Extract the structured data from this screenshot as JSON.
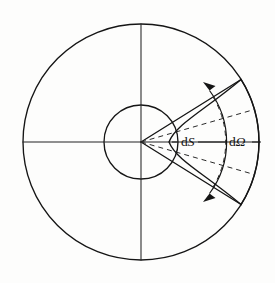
{
  "figure": {
    "background_color": "#fdfdfc",
    "line_color": "#151515",
    "labels": {
      "area_element": "dS",
      "solid_angle": "dΩ",
      "area_element_prefix": "d",
      "area_element_symbol": "S",
      "solid_angle_prefix": "d",
      "solid_angle_symbol": "Ω"
    },
    "geometry": {
      "center_x": 141,
      "center_y": 142,
      "outer_radius": 118,
      "inner_radius": 37,
      "sector_half_angle_deg": 32,
      "dashed_half_angle_deg": 16,
      "arrow_arc_radius": 86,
      "axis_lines": [
        "horizontal",
        "vertical"
      ]
    },
    "elements": [
      "outer-circle",
      "inner-circle",
      "horizontal-axis",
      "vertical-axis",
      "sector-upper-edge",
      "sector-lower-edge",
      "sector-outer-arc",
      "dashed-upper-ray",
      "dashed-lower-ray",
      "dashed-mid-ray",
      "dashed-inner-arc",
      "angle-arrow-arc",
      "dS-label",
      "dOmega-label"
    ]
  }
}
